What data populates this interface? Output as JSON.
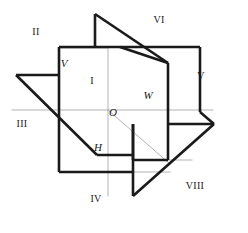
{
  "figure": {
    "background_color": "#ffffff",
    "stroke_color_outline": "#1a1a1a",
    "stroke_color_interior": "#b3b3b3",
    "outline_width": 2.6,
    "interior_width": 1.0,
    "width": 248,
    "height": 233
  },
  "region_labels": [
    {
      "id": "region-1",
      "text": "I",
      "x": 92,
      "y": 82
    },
    {
      "id": "region-2",
      "text": "II",
      "x": 34,
      "y": 33
    },
    {
      "id": "region-3",
      "text": "III",
      "x": 21,
      "y": 125
    },
    {
      "id": "region-4",
      "text": "IV",
      "x": 94,
      "y": 200
    },
    {
      "id": "region-5",
      "text": "V",
      "x": 199,
      "y": 77
    },
    {
      "id": "region-6",
      "text": "VI",
      "x": 157,
      "y": 21
    },
    {
      "id": "region-8",
      "text": "VIII",
      "x": 193,
      "y": 187
    }
  ],
  "point_labels": [
    {
      "id": "point-v",
      "text": "V",
      "x": 61,
      "y": 63
    },
    {
      "id": "point-o",
      "text": "O",
      "x": 113,
      "y": 114
    },
    {
      "id": "point-w",
      "text": "W",
      "x": 147,
      "y": 96
    },
    {
      "id": "point-h",
      "text": "H",
      "x": 97,
      "y": 155
    }
  ],
  "interior_lines": [
    {
      "id": "line-o-left",
      "x1": 12,
      "y1": 110,
      "x2": 108,
      "y2": 110
    },
    {
      "id": "line-o-right",
      "x1": 108,
      "y1": 110,
      "x2": 213,
      "y2": 110
    },
    {
      "id": "line-o-up",
      "x1": 108,
      "y1": 47,
      "x2": 108,
      "y2": 110
    },
    {
      "id": "line-o-down",
      "x1": 108,
      "y1": 110,
      "x2": 108,
      "y2": 172
    },
    {
      "id": "line-o-diag",
      "x1": 108,
      "y1": 110,
      "x2": 168,
      "y2": 163
    },
    {
      "id": "line-front-v",
      "x1": 59,
      "y1": 110,
      "x2": 59,
      "y2": 172
    },
    {
      "id": "line-front-h",
      "x1": 59,
      "y1": 172,
      "x2": 168,
      "y2": 172
    }
  ],
  "outline_paths": [
    {
      "id": "outline-vertical-plane",
      "d": "M 59 48 L 156 48 L 156 173 L 59 173 Z"
    },
    {
      "id": "outline-top-triangle",
      "d": "M 95 14 L 95 48 L 140 48"
    },
    {
      "id": "outline-apex-diagonal",
      "d": "M 95 14 L 168 63"
    }
  ]
}
